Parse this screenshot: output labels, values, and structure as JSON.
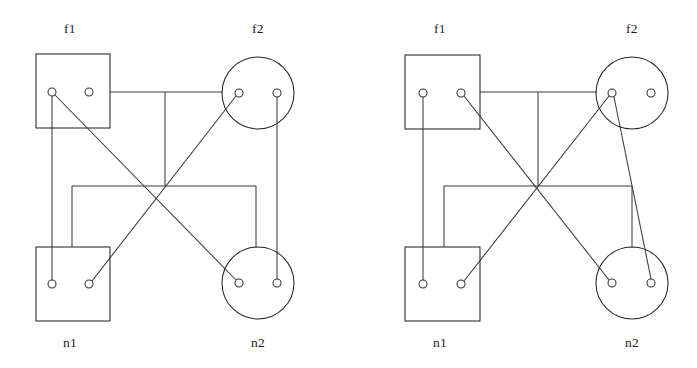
{
  "figure": {
    "title": "",
    "background_color": "#ffffff",
    "stroke_color": "#333333",
    "width": 697,
    "height": 368,
    "panel_count": 2
  },
  "panels": [
    {
      "id": "left-panel",
      "name": "left-diagram",
      "nodes": [
        {
          "id": "L-f1",
          "label": "f1",
          "shape": "square",
          "label_position": "top",
          "label_x": 70,
          "label_y": 33,
          "x": 36,
          "y": 54,
          "width": 74,
          "height": 74,
          "ports": [
            {
              "id": "L-f1-p1",
              "name": "f1-port-left",
              "cx": 52,
              "cy": 92,
              "r": 4
            },
            {
              "id": "L-f1-p2",
              "name": "f1-port-right",
              "cx": 89,
              "cy": 92,
              "r": 4
            }
          ]
        },
        {
          "id": "L-f2",
          "label": "f2",
          "shape": "circle",
          "label_position": "top",
          "label_x": 258,
          "label_y": 33,
          "cx": 258,
          "cy": 93,
          "r": 36,
          "ports": [
            {
              "id": "L-f2-p1",
              "name": "f2-port-left",
              "cx": 239,
              "cy": 93,
              "r": 4
            },
            {
              "id": "L-f2-p2",
              "name": "f2-port-right",
              "cx": 277,
              "cy": 93,
              "r": 4
            }
          ]
        },
        {
          "id": "L-n1",
          "label": "n1",
          "shape": "square",
          "label_position": "bottom",
          "label_x": 70,
          "label_y": 347,
          "x": 36,
          "y": 247,
          "width": 74,
          "height": 74,
          "ports": [
            {
              "id": "L-n1-p1",
              "name": "n1-port-left",
              "cx": 52,
              "cy": 284,
              "r": 4
            },
            {
              "id": "L-n1-p2",
              "name": "n1-port-right",
              "cx": 89,
              "cy": 284,
              "r": 4
            }
          ]
        },
        {
          "id": "L-n2",
          "label": "n2",
          "shape": "circle",
          "label_position": "bottom",
          "label_x": 258,
          "label_y": 347,
          "cx": 258,
          "cy": 283,
          "r": 36,
          "ports": [
            {
              "id": "L-n2-p1",
              "name": "n2-port-left",
              "cx": 239,
              "cy": 283,
              "r": 4
            },
            {
              "id": "L-n2-p2",
              "name": "n2-port-right",
              "cx": 277,
              "cy": 283,
              "r": 4
            }
          ]
        }
      ],
      "edges": [
        {
          "id": "L-e1",
          "name": "edge-f1left-to-n1left",
          "style": "straight",
          "from": "L-f1-p1",
          "to": "L-n1-p1",
          "path": "M 52 96 L 52 280"
        },
        {
          "id": "L-e2",
          "name": "edge-f1left-to-n2left",
          "style": "diagonal",
          "from": "L-f1-p1",
          "to": "L-n2-p1",
          "path": "M 55 95 L 236 280"
        },
        {
          "id": "L-e3",
          "name": "edge-f2left-to-n1right",
          "style": "diagonal",
          "from": "L-f2-p1",
          "to": "L-n1-p2",
          "path": "M 236 96 L 92 281"
        },
        {
          "id": "L-e4",
          "name": "edge-f2right-to-n2right",
          "style": "straight",
          "from": "L-f2-p2",
          "to": "L-n2-p2",
          "path": "M 277 97 L 277 279"
        },
        {
          "id": "L-e5",
          "name": "edge-f1box-to-f2circle-bus",
          "style": "orthogonal",
          "from": "L-f1",
          "to": "L-f2",
          "path": "M 110 92 L 223 92"
        },
        {
          "id": "L-e6",
          "name": "edge-top-bus-dropdown",
          "style": "orthogonal",
          "from": "top-bus",
          "to": "mid-bus",
          "path": "M 165 92 L 165 186"
        },
        {
          "id": "L-e7",
          "name": "edge-mid-bus-horizontal",
          "style": "orthogonal",
          "from": "n1-branch",
          "to": "n2-branch",
          "path": "M 72 186 L 256 186"
        },
        {
          "id": "L-e8",
          "name": "edge-mid-bus-to-n1box",
          "style": "orthogonal",
          "from": "mid-bus",
          "to": "L-n1",
          "path": "M 72 186 L 72 247"
        },
        {
          "id": "L-e9",
          "name": "edge-mid-bus-to-n2circle",
          "style": "orthogonal",
          "from": "mid-bus",
          "to": "L-n2",
          "path": "M 256 186 L 256 248"
        }
      ]
    },
    {
      "id": "right-panel",
      "name": "right-diagram",
      "nodes": [
        {
          "id": "R-f1",
          "label": "f1",
          "shape": "square",
          "label_position": "top",
          "label_x": 440,
          "label_y": 33,
          "x": 405,
          "y": 55,
          "width": 75,
          "height": 74,
          "ports": [
            {
              "id": "R-f1-p1",
              "name": "f1-port-left",
              "cx": 423,
              "cy": 93,
              "r": 4
            },
            {
              "id": "R-f1-p2",
              "name": "f1-port-right",
              "cx": 461,
              "cy": 93,
              "r": 4
            }
          ]
        },
        {
          "id": "R-f2",
          "label": "f2",
          "shape": "circle",
          "label_position": "top",
          "label_x": 632,
          "label_y": 33,
          "cx": 632,
          "cy": 93,
          "r": 36,
          "ports": [
            {
              "id": "R-f2-p1",
              "name": "f2-port-left",
              "cx": 612,
              "cy": 93,
              "r": 4
            },
            {
              "id": "R-f2-p2",
              "name": "f2-port-right",
              "cx": 651,
              "cy": 93,
              "r": 4
            }
          ]
        },
        {
          "id": "R-n1",
          "label": "n1",
          "shape": "square",
          "label_position": "bottom",
          "label_x": 440,
          "label_y": 347,
          "x": 405,
          "y": 247,
          "width": 75,
          "height": 74,
          "ports": [
            {
              "id": "R-n1-p1",
              "name": "n1-port-left",
              "cx": 423,
              "cy": 284,
              "r": 4
            },
            {
              "id": "R-n1-p2",
              "name": "n1-port-right",
              "cx": 461,
              "cy": 284,
              "r": 4
            }
          ]
        },
        {
          "id": "R-n2",
          "label": "n2",
          "shape": "circle",
          "label_position": "bottom",
          "label_x": 632,
          "label_y": 347,
          "cx": 632,
          "cy": 283,
          "r": 36,
          "ports": [
            {
              "id": "R-n2-p1",
              "name": "n2-port-left",
              "cx": 612,
              "cy": 283,
              "r": 4
            },
            {
              "id": "R-n2-p2",
              "name": "n2-port-right",
              "cx": 651,
              "cy": 283,
              "r": 4
            }
          ]
        }
      ],
      "edges": [
        {
          "id": "R-e1",
          "name": "edge-f1left-to-n1left",
          "style": "straight",
          "from": "R-f1-p1",
          "to": "R-n1-p1",
          "path": "M 423 97 L 423 280"
        },
        {
          "id": "R-e2",
          "name": "edge-f1right-to-n2left",
          "style": "diagonal",
          "from": "R-f1-p2",
          "to": "R-n2-p1",
          "path": "M 464 96 L 609 280"
        },
        {
          "id": "R-e3",
          "name": "edge-f2left-to-n1right",
          "style": "diagonal",
          "from": "R-f2-p1",
          "to": "R-n1-p2",
          "path": "M 609 96 L 464 281"
        },
        {
          "id": "R-e4",
          "name": "edge-f2left-to-n2right",
          "style": "diagonal",
          "from": "R-f2-p1",
          "to": "R-n2-p2",
          "path": "M 614 97 L 651 279"
        },
        {
          "id": "R-e5",
          "name": "edge-f1box-to-f2circle-bus",
          "style": "orthogonal",
          "from": "R-f1",
          "to": "R-f2",
          "path": "M 480 92 L 597 92"
        },
        {
          "id": "R-e6",
          "name": "edge-top-bus-dropdown",
          "style": "orthogonal",
          "from": "top-bus",
          "to": "mid-bus",
          "path": "M 538 92 L 538 186"
        },
        {
          "id": "R-e7",
          "name": "edge-mid-bus-horizontal",
          "style": "orthogonal",
          "from": "n1-branch",
          "to": "n2-branch",
          "path": "M 444 186 L 632 186"
        },
        {
          "id": "R-e8",
          "name": "edge-mid-bus-to-n1box",
          "style": "orthogonal",
          "from": "mid-bus",
          "to": "R-n1",
          "path": "M 444 186 L 444 247"
        },
        {
          "id": "R-e9",
          "name": "edge-mid-bus-to-n2circle",
          "style": "orthogonal",
          "from": "mid-bus",
          "to": "R-n2",
          "path": "M 632 186 L 632 248"
        }
      ]
    }
  ]
}
